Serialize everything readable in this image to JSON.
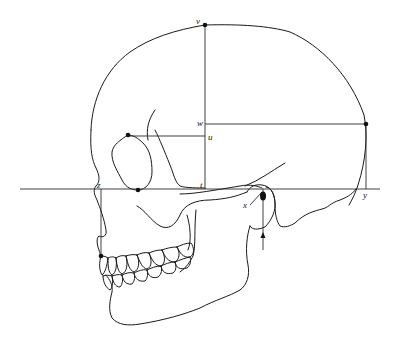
{
  "figure": {
    "colors": {
      "line": "#1a1a1a",
      "background": "#ffffff",
      "landmark": "#111111"
    }
  },
  "labels": {
    "v": "v",
    "w": "w",
    "u": "u",
    "t": "t",
    "z": "z",
    "x": "x",
    "y": "y"
  },
  "landmarks": [
    {
      "id": "vertex",
      "label": "v",
      "x": 205,
      "y": 25
    },
    {
      "id": "opisthocranion",
      "label": "",
      "x": 366,
      "y": 124
    },
    {
      "id": "orbit-top",
      "label": "",
      "x": 128,
      "y": 135
    },
    {
      "id": "orbit-bottom",
      "label": "",
      "x": 138,
      "y": 190
    },
    {
      "id": "porion",
      "label": "",
      "x": 263,
      "y": 192
    },
    {
      "id": "prosthion",
      "label": "",
      "x": 101,
      "y": 256
    }
  ],
  "reference_lines": {
    "frankfort_horizontal_y": 189,
    "vertical_v_x": 205,
    "horizontal_w_y": 124,
    "horizontal_u_y": 136,
    "vertical_z_x": 101,
    "vertical_y_x": 366,
    "vertical_x_x": 263
  }
}
